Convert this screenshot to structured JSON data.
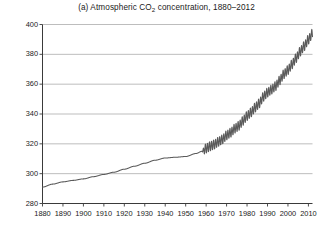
{
  "chart_data": {
    "type": "line",
    "title": "(a) Atmospheric CO2 concentration, 1880–2012",
    "title_prefix": "(a) Atmospheric CO",
    "title_sub": "2",
    "title_suffix": " concentration, 1880–2012",
    "xlabel": "",
    "ylabel": "",
    "xlim": [
      1880,
      2012
    ],
    "ylim": [
      280,
      400
    ],
    "xticks": [
      1880,
      1890,
      1900,
      1910,
      1920,
      1930,
      1940,
      1950,
      1960,
      1970,
      1980,
      1990,
      2000,
      2010
    ],
    "yticks": [
      280,
      300,
      320,
      340,
      360,
      380,
      400
    ],
    "grid": "horizontal",
    "legend": "none",
    "line_color": "#5a5a5a",
    "grid_color": "#b5b5b5",
    "axis_color": "#3a3a3a",
    "series": [
      {
        "name": "Atmospheric CO2 concentration (ppm)",
        "note": "Smooth ice-core record 1880-1958, then Mauna Loa Keeling curve with annual sawtooth oscillation (~6 ppm peak-to-peak) 1958-2012",
        "x": [
          1880,
          1885,
          1890,
          1895,
          1900,
          1905,
          1910,
          1915,
          1920,
          1925,
          1930,
          1935,
          1940,
          1945,
          1950,
          1955,
          1958,
          1960,
          1962,
          1964,
          1966,
          1968,
          1970,
          1972,
          1974,
          1976,
          1978,
          1980,
          1982,
          1984,
          1986,
          1988,
          1990,
          1992,
          1994,
          1996,
          1998,
          2000,
          2002,
          2004,
          2006,
          2008,
          2010,
          2012
        ],
        "values": [
          291.0,
          293.0,
          294.5,
          295.5,
          296.5,
          298.0,
          299.5,
          301.0,
          303.0,
          305.0,
          307.0,
          309.0,
          310.5,
          311.0,
          311.5,
          313.5,
          315.0,
          316.9,
          318.4,
          319.6,
          321.4,
          323.0,
          325.7,
          327.5,
          330.2,
          332.1,
          335.4,
          338.7,
          341.1,
          344.4,
          347.2,
          351.6,
          354.4,
          356.4,
          358.8,
          362.6,
          366.7,
          369.5,
          373.3,
          377.5,
          381.9,
          385.6,
          389.9,
          394.0
        ]
      }
    ]
  }
}
